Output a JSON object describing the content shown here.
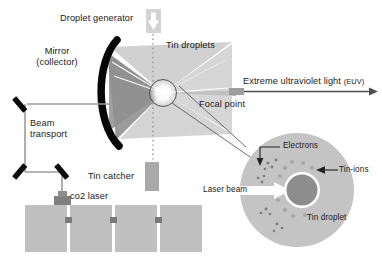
{
  "diagram": {
    "labels": {
      "droplet_generator": "Droplet generator",
      "tin_droplets": "Tin droplets",
      "mirror_line1": "Mirror",
      "mirror_line2": "(collector)",
      "beam_transport_line1": "Beam",
      "beam_transport_line2": "transport",
      "tin_catcher": "Tin catcher",
      "co2_laser": "co2 laser",
      "focal_point": "Focal point",
      "euv_main": "Extreme ultraviolet light",
      "euv_abbrev": "(EUV)"
    },
    "inset_labels": {
      "electrons": "Electrons",
      "tin_ions": "Tin-ions",
      "tin_droplet": "Tin droplet",
      "laser_beam": "Laser beam"
    },
    "icons": {
      "droplet_arrow": "down-arrow-icon",
      "euv_arrow": "right-arrow-icon",
      "laser_beam_arrow": "right-arrow-icon",
      "electrons_pointer": "arrow-down-pointer-icon",
      "tin_ions_pointer": "arrow-left-pointer-icon"
    },
    "colors": {
      "background": "#ffffff",
      "text": "#1a1a1a",
      "mirror_black": "#080808",
      "cone_dark": "#9a9a9a",
      "cone_mid": "#b6b6b6",
      "cone_light": "#cfcfcf",
      "block_gray": "#bdbdbd",
      "inset_fill": "#c2c2c2",
      "droplet_fill": "#8d8d8d",
      "line_gray": "#9b9b9b",
      "arrow_gray": "#8a8a8a",
      "focal_rect": "#9e9e9e"
    },
    "geometry": {
      "canvas_width": 382,
      "canvas_height": 264,
      "focal_point_xy": [
        163,
        93
      ],
      "inset_center_xy": [
        297,
        190
      ],
      "inset_radius": 57,
      "droplet_radius": 17,
      "machine_blocks": 4
    }
  }
}
